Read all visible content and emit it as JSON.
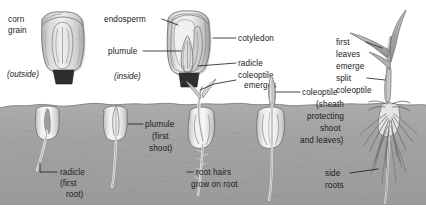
{
  "diagram": {
    "colors": {
      "background": "#ffffff",
      "soil": "#a3a3a3",
      "soil_dark": "#909090",
      "seed_light": "#efefef",
      "seed_mid": "#c9c9c9",
      "seed_shadow": "#a8a8a8",
      "shoot": "#d8d8d8",
      "leaf": "#b5b5b5",
      "root": "#f2f2f2",
      "outline": "#4a4a4a",
      "text": "#1a1a1a"
    },
    "labels": {
      "corn_grain": "corn\ngrain",
      "corn_grain_line1": "corn",
      "corn_grain_line2": "grain",
      "outside": "(outside)",
      "endosperm": "endosperm",
      "plumule_top": "plumule",
      "inside": "(inside)",
      "cotyledon": "cotyledon",
      "radicle_top": "radicle",
      "coleoptile_emerges_line1": "coleoptile",
      "coleoptile_emerges_line2": "emerges",
      "first_leaves_line1": "first",
      "first_leaves_line2": "leaves",
      "first_leaves_line3": "emerge",
      "split_line1": "split",
      "split_line2": "coleoptile",
      "radicle_first_root_line1": "radicle",
      "radicle_first_root_line2": "(first",
      "radicle_first_root_line3": "root)",
      "plumule_first_shoot_line1": "plumule",
      "plumule_first_shoot_line2": "(first",
      "plumule_first_shoot_line3": "shoot)",
      "root_hairs_line1": "root hairs",
      "root_hairs_line2": "grow on root",
      "coleoptile_sheath_line1": "coleoptile",
      "coleoptile_sheath_line2": "(sheath",
      "coleoptile_sheath_line3": "protecting",
      "coleoptile_sheath_line4": "shoot",
      "coleoptile_sheath_line5": "and leaves)",
      "side_roots_line1": "side",
      "side_roots_line2": "roots"
    },
    "stages": [
      {
        "name": "corn-grain-outside",
        "caption": "(outside)"
      },
      {
        "name": "corn-grain-inside",
        "caption": "(inside)"
      },
      {
        "name": "radicle-emerges",
        "caption": "radicle (first root)"
      },
      {
        "name": "plumule-emerges",
        "caption": "plumule (first shoot)"
      },
      {
        "name": "coleoptile-emerges",
        "caption": "coleoptile emerges"
      },
      {
        "name": "root-hairs",
        "caption": "root hairs grow on root"
      },
      {
        "name": "coleoptile-sheath",
        "caption": "coleoptile (sheath protecting shoot and leaves)"
      },
      {
        "name": "first-leaves-emerge",
        "caption": "first leaves emerge / split coleoptile / side roots"
      }
    ]
  }
}
